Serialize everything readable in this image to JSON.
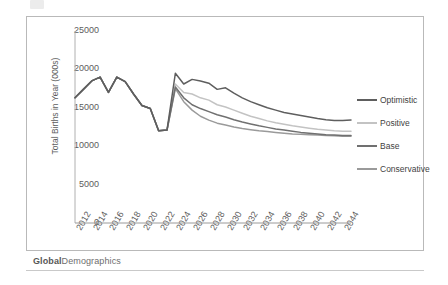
{
  "watermark": {
    "bold": "Global",
    "rest": "Demographics"
  },
  "chart_data": {
    "type": "line",
    "title": "",
    "xlabel": "",
    "ylabel": "Total Births in Year (000s)",
    "ylim": [
      0,
      25000
    ],
    "ytick_labels": [
      "25000",
      "20000",
      "15000",
      "10000",
      "5000",
      "0"
    ],
    "yticks": [
      25000,
      20000,
      15000,
      10000,
      5000,
      0
    ],
    "xlim": [
      2012,
      2045
    ],
    "xtick_labels": [
      "2012",
      "2014",
      "2016",
      "2018",
      "2020",
      "2022",
      "2024",
      "2026",
      "2028",
      "2030",
      "2032",
      "2034",
      "2036",
      "2038",
      "2040",
      "2042",
      "2044"
    ],
    "xticks": [
      2012,
      2014,
      2016,
      2018,
      2020,
      2022,
      2024,
      2026,
      2028,
      2030,
      2032,
      2034,
      2036,
      2038,
      2040,
      2042,
      2044
    ],
    "grid": false,
    "legend_position": "right",
    "x": [
      2012,
      2013,
      2014,
      2015,
      2016,
      2017,
      2018,
      2019,
      2020,
      2021,
      2022,
      2023,
      2024,
      2025,
      2026,
      2027,
      2028,
      2029,
      2030,
      2031,
      2032,
      2033,
      2034,
      2035,
      2036,
      2037,
      2038,
      2039,
      2040,
      2041,
      2042,
      2043,
      2044,
      2045
    ],
    "series": [
      {
        "name": "Optimistic",
        "color": "#5e5e5e",
        "values": [
          16300,
          17400,
          18500,
          19000,
          17000,
          19000,
          18400,
          16800,
          15300,
          14900,
          12000,
          12100,
          19500,
          18100,
          18700,
          18500,
          18200,
          17400,
          17600,
          16900,
          16300,
          15800,
          15400,
          15000,
          14700,
          14400,
          14200,
          14000,
          13800,
          13600,
          13450,
          13350,
          13350,
          13400
        ]
      },
      {
        "name": "Positive",
        "color": "#c3c3c3",
        "values": [
          16300,
          17400,
          18500,
          19000,
          17000,
          19000,
          18400,
          16800,
          15300,
          14900,
          12000,
          12100,
          18100,
          17000,
          16800,
          16300,
          16000,
          15400,
          15100,
          14700,
          14300,
          13900,
          13600,
          13300,
          13050,
          12850,
          12650,
          12500,
          12350,
          12200,
          12100,
          12000,
          11950,
          11950
        ]
      },
      {
        "name": "Base",
        "color": "#707070",
        "values": [
          16300,
          17400,
          18500,
          19000,
          17000,
          19000,
          18400,
          16800,
          15300,
          14900,
          12000,
          12100,
          17700,
          16300,
          15400,
          14900,
          14500,
          14100,
          13800,
          13450,
          13150,
          12900,
          12650,
          12450,
          12250,
          12100,
          11950,
          11800,
          11700,
          11600,
          11500,
          11450,
          11400,
          11400
        ]
      },
      {
        "name": "Conservative",
        "color": "#9a9a9a",
        "values": [
          16300,
          17400,
          18500,
          19000,
          17000,
          19000,
          18400,
          16800,
          15300,
          14900,
          12000,
          12100,
          17500,
          15800,
          14700,
          13900,
          13400,
          13000,
          12750,
          12500,
          12300,
          12150,
          12000,
          11900,
          11800,
          11700,
          11600,
          11550,
          11500,
          11450,
          11400,
          11350,
          11300,
          11300
        ]
      }
    ]
  }
}
